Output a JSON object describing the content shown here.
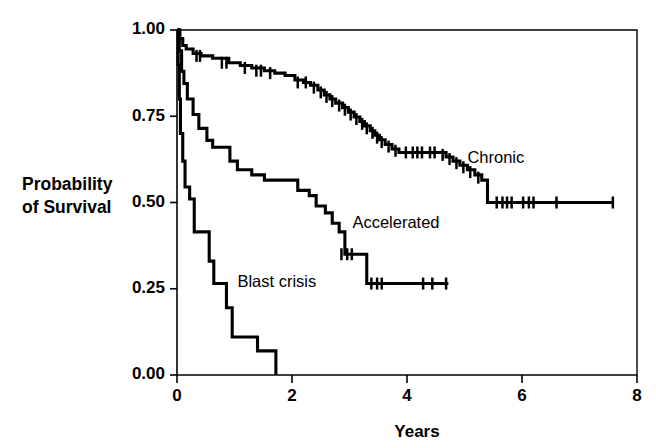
{
  "chart_data": {
    "type": "line",
    "subtype": "kaplan-meier-survival-step",
    "title": "",
    "xlabel": "Years",
    "ylabel": "Probability of Survival",
    "ylabel_line1": "Probability",
    "ylabel_line2": "of Survival",
    "xlim": [
      0,
      8
    ],
    "ylim": [
      0,
      1
    ],
    "xticks": [
      0,
      2,
      4,
      6,
      8
    ],
    "xtick_labels": [
      "0",
      "2",
      "4",
      "6",
      "8"
    ],
    "yticks": [
      0.0,
      0.25,
      0.5,
      0.75,
      1.0
    ],
    "ytick_labels": [
      "0.00",
      "0.25",
      "0.50",
      "0.75",
      "1.00"
    ],
    "grid": false,
    "legend_position": "inline-annotations",
    "line_color": "#000000",
    "background_color": "#ffffff",
    "censor_marker": "plus-tick",
    "series": [
      {
        "name": "Chronic",
        "label": "Chronic",
        "label_x": 5.05,
        "label_y": 0.615,
        "final_value": 0.5,
        "max_followup_years": 7.6,
        "steps": [
          [
            0.0,
            1.0
          ],
          [
            0.05,
            0.975
          ],
          [
            0.1,
            0.955
          ],
          [
            0.16,
            0.945
          ],
          [
            0.28,
            0.932
          ],
          [
            0.42,
            0.925
          ],
          [
            0.62,
            0.918
          ],
          [
            0.9,
            0.905
          ],
          [
            1.1,
            0.897
          ],
          [
            1.3,
            0.89
          ],
          [
            1.52,
            0.882
          ],
          [
            1.7,
            0.875
          ],
          [
            1.88,
            0.868
          ],
          [
            2.05,
            0.855
          ],
          [
            2.2,
            0.848
          ],
          [
            2.32,
            0.84
          ],
          [
            2.45,
            0.826
          ],
          [
            2.56,
            0.812
          ],
          [
            2.66,
            0.8
          ],
          [
            2.76,
            0.788
          ],
          [
            2.88,
            0.775
          ],
          [
            2.98,
            0.762
          ],
          [
            3.08,
            0.748
          ],
          [
            3.18,
            0.735
          ],
          [
            3.26,
            0.722
          ],
          [
            3.36,
            0.708
          ],
          [
            3.44,
            0.695
          ],
          [
            3.52,
            0.682
          ],
          [
            3.62,
            0.668
          ],
          [
            3.74,
            0.655
          ],
          [
            3.86,
            0.645
          ],
          [
            4.55,
            0.645
          ],
          [
            4.68,
            0.632
          ],
          [
            4.8,
            0.62
          ],
          [
            4.92,
            0.608
          ],
          [
            5.05,
            0.595
          ],
          [
            5.18,
            0.58
          ],
          [
            5.3,
            0.565
          ],
          [
            5.4,
            0.5
          ],
          [
            7.6,
            0.5
          ]
        ],
        "censor_points": [
          [
            0.34,
            0.925
          ],
          [
            0.4,
            0.925
          ],
          [
            0.78,
            0.905
          ],
          [
            0.86,
            0.905
          ],
          [
            1.18,
            0.89
          ],
          [
            1.38,
            0.882
          ],
          [
            1.46,
            0.882
          ],
          [
            1.62,
            0.875
          ],
          [
            2.1,
            0.848
          ],
          [
            2.24,
            0.848
          ],
          [
            2.38,
            0.833
          ],
          [
            2.5,
            0.819
          ],
          [
            2.6,
            0.806
          ],
          [
            2.7,
            0.794
          ],
          [
            2.82,
            0.781
          ],
          [
            2.92,
            0.769
          ],
          [
            3.02,
            0.755
          ],
          [
            3.12,
            0.742
          ],
          [
            3.22,
            0.728
          ],
          [
            3.3,
            0.715
          ],
          [
            3.4,
            0.702
          ],
          [
            3.48,
            0.688
          ],
          [
            3.56,
            0.675
          ],
          [
            3.68,
            0.662
          ],
          [
            3.8,
            0.65
          ],
          [
            3.98,
            0.645
          ],
          [
            4.1,
            0.645
          ],
          [
            4.18,
            0.645
          ],
          [
            4.26,
            0.645
          ],
          [
            4.4,
            0.645
          ],
          [
            4.48,
            0.645
          ],
          [
            4.62,
            0.638
          ],
          [
            4.74,
            0.626
          ],
          [
            4.86,
            0.614
          ],
          [
            4.98,
            0.602
          ],
          [
            5.1,
            0.588
          ],
          [
            5.24,
            0.572
          ],
          [
            5.56,
            0.5
          ],
          [
            5.66,
            0.5
          ],
          [
            5.74,
            0.5
          ],
          [
            5.82,
            0.5
          ],
          [
            6.02,
            0.5
          ],
          [
            6.12,
            0.5
          ],
          [
            6.2,
            0.5
          ],
          [
            6.6,
            0.5
          ],
          [
            7.58,
            0.5
          ]
        ]
      },
      {
        "name": "Accelerated",
        "label": "Accelerated",
        "label_x": 3.05,
        "label_y": 0.425,
        "final_value": 0.26,
        "max_followup_years": 4.72,
        "steps": [
          [
            0.0,
            1.0
          ],
          [
            0.04,
            0.94
          ],
          [
            0.08,
            0.88
          ],
          [
            0.12,
            0.845
          ],
          [
            0.18,
            0.8
          ],
          [
            0.28,
            0.755
          ],
          [
            0.38,
            0.715
          ],
          [
            0.52,
            0.68
          ],
          [
            0.62,
            0.66
          ],
          [
            0.8,
            0.66
          ],
          [
            0.92,
            0.62
          ],
          [
            1.05,
            0.595
          ],
          [
            1.3,
            0.58
          ],
          [
            1.52,
            0.565
          ],
          [
            1.95,
            0.565
          ],
          [
            2.1,
            0.535
          ],
          [
            2.3,
            0.52
          ],
          [
            2.42,
            0.49
          ],
          [
            2.58,
            0.47
          ],
          [
            2.7,
            0.44
          ],
          [
            2.82,
            0.415
          ],
          [
            2.92,
            0.35
          ],
          [
            3.22,
            0.35
          ],
          [
            3.3,
            0.265
          ],
          [
            4.72,
            0.265
          ]
        ],
        "censor_points": [
          [
            2.86,
            0.35
          ],
          [
            2.96,
            0.35
          ],
          [
            3.04,
            0.35
          ],
          [
            3.38,
            0.265
          ],
          [
            3.48,
            0.265
          ],
          [
            3.56,
            0.265
          ],
          [
            4.28,
            0.265
          ],
          [
            4.44,
            0.265
          ],
          [
            4.68,
            0.265
          ]
        ]
      },
      {
        "name": "Blast crisis",
        "label": "Blast crisis",
        "label_x": 1.05,
        "label_y": 0.255,
        "final_value": 0.0,
        "max_followup_years": 1.72,
        "steps": [
          [
            0.0,
            1.0
          ],
          [
            0.02,
            0.9
          ],
          [
            0.04,
            0.8
          ],
          [
            0.06,
            0.7
          ],
          [
            0.1,
            0.62
          ],
          [
            0.14,
            0.545
          ],
          [
            0.22,
            0.51
          ],
          [
            0.3,
            0.415
          ],
          [
            0.48,
            0.415
          ],
          [
            0.56,
            0.33
          ],
          [
            0.64,
            0.265
          ],
          [
            0.78,
            0.265
          ],
          [
            0.86,
            0.195
          ],
          [
            0.96,
            0.11
          ],
          [
            1.32,
            0.11
          ],
          [
            1.4,
            0.07
          ],
          [
            1.7,
            0.07
          ],
          [
            1.72,
            0.0
          ]
        ],
        "censor_points": []
      }
    ]
  },
  "plot_geometry": {
    "left_px": 177,
    "right_px": 637,
    "top_px": 30,
    "bottom_px": 375,
    "px_per_year": 57.5,
    "px_per_unit_prob": 345
  },
  "annotations": {
    "chronic": "Chronic",
    "accelerated": "Accelerated",
    "blast_crisis": "Blast crisis"
  }
}
